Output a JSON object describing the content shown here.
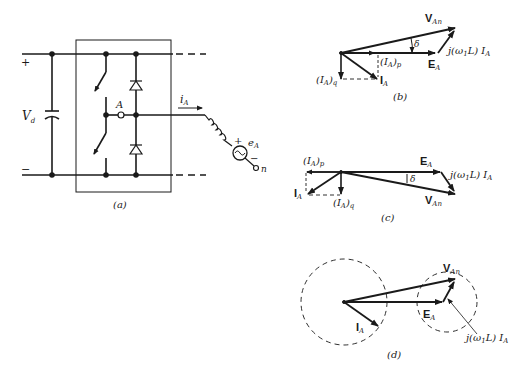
{
  "figure": {
    "panels": [
      {
        "id": "a",
        "caption": "(a)",
        "type": "inverter-leg-circuit",
        "labels": {
          "plus": "+",
          "minus": "−",
          "dc_voltage": "V",
          "dc_voltage_sub": "d",
          "node": "A",
          "current": "i",
          "current_sub": "A",
          "emf": "e",
          "emf_sub": "A",
          "emf_plus": "+",
          "emf_minus": "−",
          "neutral": "n"
        }
      },
      {
        "id": "b",
        "caption": "(b)",
        "type": "phasor-diagram",
        "labels": {
          "v_an": "V",
          "v_an_sub": "An",
          "delta": "δ",
          "jwl": "j(ω",
          "jwl_sub": "1",
          "jwl_tail": "L) I",
          "jwl_tail_sub": "A",
          "e_a": "E",
          "e_a_sub": "A",
          "ia_p": "(I",
          "ia_p_sub": "A",
          "ia_p_tail": ")",
          "ia_p_tail_sub": "p",
          "ia_q": "(I",
          "ia_q_sub": "A",
          "ia_q_tail": ")",
          "ia_q_tail_sub": "q",
          "i_a": "I",
          "i_a_sub": "A"
        }
      },
      {
        "id": "c",
        "caption": "(c)",
        "type": "phasor-diagram",
        "labels": {
          "ia_p": "(I",
          "ia_p_sub": "A",
          "ia_p_tail": ")",
          "ia_p_tail_sub": "p",
          "e_a": "E",
          "e_a_sub": "A",
          "jwl": "j(ω",
          "jwl_sub": "1",
          "jwl_tail": "L) I",
          "jwl_tail_sub": "A",
          "delta": "δ",
          "i_a": "I",
          "i_a_sub": "A",
          "ia_q": "(I",
          "ia_q_sub": "A",
          "ia_q_tail": ")",
          "ia_q_tail_sub": "q",
          "v_an": "V",
          "v_an_sub": "An"
        }
      },
      {
        "id": "d",
        "caption": "(d)",
        "type": "phasor-diagram-with-circles",
        "labels": {
          "v_an": "V",
          "v_an_sub": "An",
          "e_a": "E",
          "e_a_sub": "A",
          "i_a": "I",
          "i_a_sub": "A",
          "jwl": "j(ω",
          "jwl_sub": "1",
          "jwl_tail": "L) I",
          "jwl_tail_sub": "A"
        }
      }
    ]
  }
}
